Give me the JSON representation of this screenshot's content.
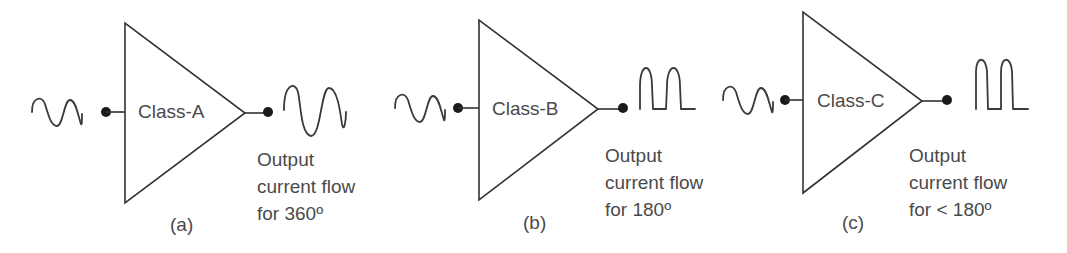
{
  "panels": [
    {
      "id": "a",
      "amplifier_label": "Class-A",
      "caption_lines": [
        "Output",
        "current flow",
        "for 360º"
      ],
      "sub_label": "(a)",
      "input_waveform": "sine-wave-icon",
      "output_waveform": "full-sine-wave",
      "conduction_angle": "360º"
    },
    {
      "id": "b",
      "amplifier_label": "Class-B",
      "caption_lines": [
        "Output",
        "current flow",
        "for 180º"
      ],
      "sub_label": "(b)",
      "input_waveform": "sine-wave-icon",
      "output_waveform": "half-wave-pulses",
      "conduction_angle": "180º"
    },
    {
      "id": "c",
      "amplifier_label": "Class-C",
      "caption_lines": [
        "Output",
        "current flow",
        "for < 180º"
      ],
      "sub_label": "(c)",
      "input_waveform": "sine-wave-icon",
      "output_waveform": "narrow-pulses",
      "conduction_angle": "< 180º"
    }
  ],
  "colors": {
    "line": "#333333",
    "text": "#4a4a4a",
    "background": "#ffffff"
  }
}
